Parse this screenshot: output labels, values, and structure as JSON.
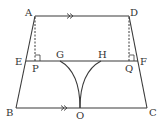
{
  "diagram": {
    "stroke_color": "#3a3a3a",
    "labels": {
      "A": "A",
      "D": "D",
      "E": "E",
      "F": "F",
      "P": "P",
      "Q": "Q",
      "G": "G",
      "H": "H",
      "B": "B",
      "C": "C",
      "O": "O"
    },
    "points": {
      "A": [
        35,
        16
      ],
      "D": [
        129,
        16
      ],
      "E": [
        26,
        61
      ],
      "F": [
        138,
        61
      ],
      "B": [
        16,
        108
      ],
      "C": [
        147,
        108
      ],
      "P": [
        35,
        61
      ],
      "Q": [
        129,
        61
      ],
      "G": [
        60,
        61
      ],
      "H": [
        101,
        61
      ],
      "O": [
        80,
        108
      ]
    },
    "annotations": {
      "parallel_marks": [
        "AD",
        "BC"
      ],
      "right_angles": [
        "P",
        "Q"
      ],
      "dashed_segments": [
        "AP",
        "DQ"
      ],
      "arcs": [
        "GO",
        "HO"
      ]
    }
  }
}
